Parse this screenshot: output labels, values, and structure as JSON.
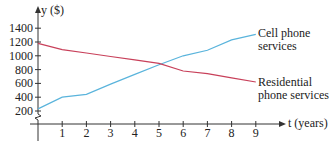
{
  "chart_data": {
    "type": "line",
    "title": "",
    "xlabel": "t (years)",
    "ylabel": "y ($)",
    "x": [
      0,
      1,
      2,
      3,
      4,
      5,
      6,
      7,
      8,
      9
    ],
    "xticks": [
      "1",
      "2",
      "3",
      "4",
      "5",
      "6",
      "7",
      "8",
      "9"
    ],
    "yticks": [
      "200",
      "400",
      "600",
      "800",
      "1000",
      "1200",
      "1400"
    ],
    "ylim": [
      0,
      1500
    ],
    "xlim": [
      0,
      10
    ],
    "grid": false,
    "axis_break": "zigzag on y-axis between 0 and 200",
    "series": [
      {
        "name": "Cell phone services",
        "label_lines": [
          "Cell phone",
          "services"
        ],
        "color": "#5ab4dc",
        "values": [
          230,
          400,
          440,
          590,
          730,
          870,
          1000,
          1080,
          1230,
          1310
        ]
      },
      {
        "name": "Residential phone services",
        "label_lines": [
          "Residential",
          "phone services"
        ],
        "color": "#c8405a",
        "values": [
          1180,
          1090,
          1040,
          990,
          940,
          890,
          780,
          740,
          680,
          620
        ]
      }
    ],
    "legend_position": "inline labels at right end of each line"
  }
}
